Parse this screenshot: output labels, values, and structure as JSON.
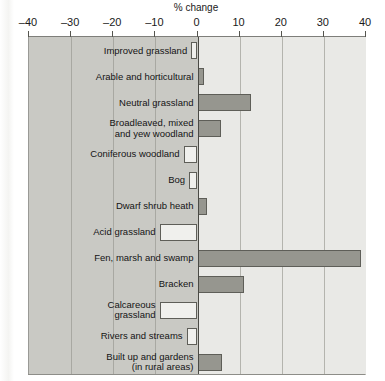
{
  "chart_data": {
    "type": "bar",
    "orientation": "horizontal",
    "title": "% change",
    "xlabel": "% change",
    "ylabel": "",
    "xlim": [
      -40,
      40
    ],
    "xticks": [
      -40,
      -30,
      -20,
      -10,
      0,
      10,
      20,
      30,
      40
    ],
    "xtick_labels": [
      "–40",
      "–30",
      "–20",
      "–10",
      "0",
      "10",
      "20",
      "30",
      "40"
    ],
    "grid": true,
    "legend": "none",
    "zero_reference_line": 0,
    "negative_region_shaded": true,
    "categories": [
      "Improved grassland",
      "Arable and horticultural",
      "Neutral grassland",
      "Broadleaved, mixed\nand yew woodland",
      "Coniferous woodland",
      "Bog",
      "Dwarf shrub heath",
      "Acid grassland",
      "Fen, marsh and swamp",
      "Bracken",
      "Calcareous\ngrassland",
      "Rivers and streams",
      "Built up and gardens\n(in rural areas)"
    ],
    "values": [
      -1.5,
      1.5,
      12.8,
      5.5,
      -3.3,
      -2.0,
      2.2,
      -9.0,
      38.8,
      11.0,
      -9.0,
      -2.6,
      5.7
    ],
    "colors": {
      "positive_bar_fill": "#96968f",
      "negative_bar_fill": "#f0f0ed",
      "bar_outline": "#5e5e58",
      "plot_background": "#e9e9e6",
      "negative_half_shade": "#c9c9c4",
      "gridline": "#b4b4ae",
      "zero_line": "#4a4a45",
      "text": "#141414"
    }
  }
}
